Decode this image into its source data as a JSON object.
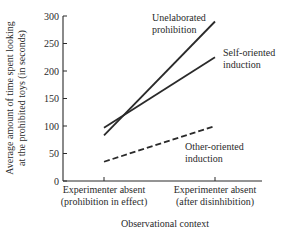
{
  "chart_data": {
    "type": "line",
    "title": "",
    "xlabel": "Observational context",
    "ylabel": [
      "Average amount of time spent looking",
      "at the prohibited toys (in seconds)"
    ],
    "ylim": [
      0,
      300
    ],
    "yticks": [
      0,
      50,
      100,
      150,
      200,
      250,
      300
    ],
    "grid": false,
    "legend_position": "inline labels at line ends",
    "categories": [
      [
        "Experimenter absent",
        "(prohibition in effect)"
      ],
      [
        "Experimenter absent",
        "(after disinhibition)"
      ]
    ],
    "series": [
      {
        "name": "Unelaborated prohibition",
        "label_lines": [
          "Unelaborated",
          "prohibition"
        ],
        "values": [
          83,
          290
        ],
        "style": "solid"
      },
      {
        "name": "Self-oriented induction",
        "label_lines": [
          "Self-oriented",
          "induction"
        ],
        "values": [
          97,
          225
        ],
        "style": "solid"
      },
      {
        "name": "Other-oriented induction",
        "label_lines": [
          "Other-oriented",
          "induction"
        ],
        "values": [
          35,
          100
        ],
        "style": "dashed"
      }
    ]
  },
  "colors": {
    "ink": "#2a2a2a",
    "background": "#ffffff"
  }
}
